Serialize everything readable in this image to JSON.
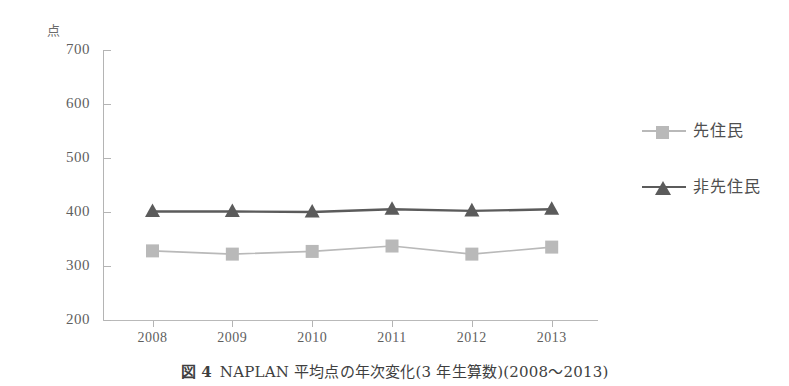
{
  "top_bleed_text": "",
  "unit_label": "点",
  "caption": {
    "figure_number": "図 4",
    "text": "NAPLAN 平均点の年次変化(3 年生算数)(2008～2013)"
  },
  "legend": {
    "items": [
      {
        "label": "先住民",
        "marker": "square-marker",
        "color": "#b9b9b9"
      },
      {
        "label": "非先住民",
        "marker": "triangle-marker",
        "color": "#5b5b5b"
      }
    ]
  },
  "colors": {
    "indigenous": "#b9b9b9",
    "non_indigenous": "#5b5b5b",
    "axis": "#b4b4b4",
    "text": "#5f5f5f"
  },
  "chart_data": {
    "type": "line",
    "title": "NAPLAN 平均点の年次変化(3 年生算数)(2008～2013)",
    "xlabel": "",
    "ylabel": "点",
    "categories": [
      "2008",
      "2009",
      "2010",
      "2011",
      "2012",
      "2013"
    ],
    "ylim": [
      200,
      700
    ],
    "yticks": [
      200,
      300,
      400,
      500,
      600,
      700
    ],
    "grid": false,
    "legend_position": "right",
    "series": [
      {
        "name": "先住民",
        "values": [
          328,
          322,
          327,
          337,
          322,
          335
        ],
        "marker": "square",
        "color": "#b9b9b9"
      },
      {
        "name": "非先住民",
        "values": [
          401,
          401,
          400,
          405,
          402,
          405
        ],
        "marker": "triangle",
        "color": "#5b5b5b"
      }
    ]
  }
}
